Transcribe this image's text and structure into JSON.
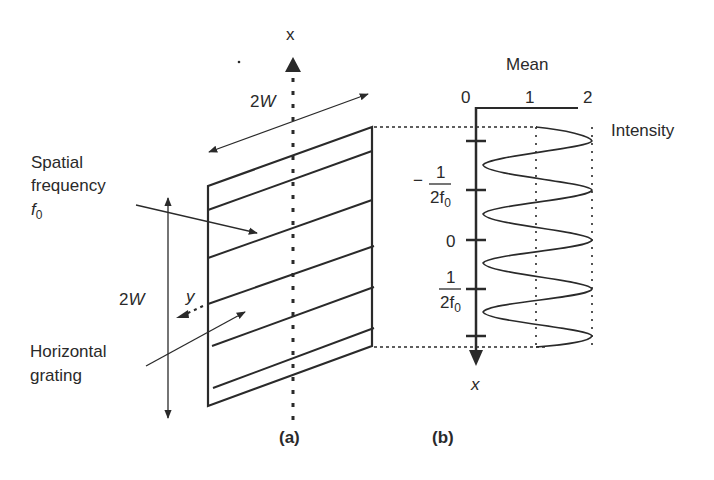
{
  "figure": {
    "panel_a": {
      "caption": "(a)",
      "axis_x_label": "x",
      "axis_y_label": "y",
      "width_label_top": "2W",
      "height_label_left": "2W",
      "annotation_spatial_frequency": {
        "line1": "Spatial",
        "line2": "frequency",
        "line3_base": "f",
        "line3_sub": "0"
      },
      "annotation_grating": {
        "line1": "Horizontal",
        "line2": "grating"
      }
    },
    "panel_b": {
      "caption": "(b)",
      "top_title": "Mean",
      "intensity_label": "Intensity",
      "axis_x_label": "x",
      "intensity_ticks": [
        "0",
        "1",
        "2"
      ],
      "position_ticks": {
        "neg_half_period": {
          "sign": "−",
          "num": "1",
          "den_base": "2f",
          "den_sub": "0"
        },
        "zero": "0",
        "pos_half_period": {
          "num": "1",
          "den_base": "2f",
          "den_sub": "0"
        }
      }
    }
  },
  "colors": {
    "ink": "#2a2a2a",
    "background": "#ffffff"
  }
}
